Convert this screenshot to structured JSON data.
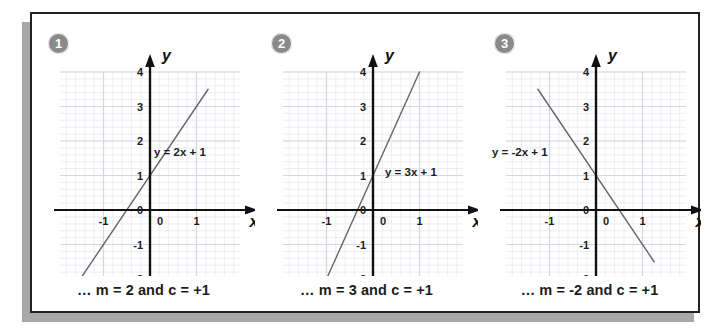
{
  "figure": {
    "background": "#ffffff",
    "border_color": "#222222",
    "shadow_color": "#a8a8a8"
  },
  "colors": {
    "badge_fill": "#8a8a8a",
    "badge_text": "#ffffff",
    "axis": "#111111",
    "grid_minor": "#e9e9f2",
    "grid_major": "#d6d6e2",
    "line": "#666666",
    "text": "#1d1d1d"
  },
  "panels": [
    {
      "badge": "1",
      "caption": "… m = 2 and c = +1",
      "equation_label": "y = 2x + 1",
      "equation_label_pos": {
        "x": 122,
        "y": 108
      },
      "axis_x_name": "x",
      "axis_y_name": "y",
      "chart_data": {
        "type": "line",
        "title": "y = 2x + 1",
        "xlabel": "x",
        "ylabel": "y",
        "slope": 2,
        "intercept": 1,
        "xlim": [
          -1.55,
          1.35
        ],
        "ylim": [
          -2,
          4
        ],
        "x_ticks": [
          -1,
          0,
          1
        ],
        "y_ticks": [
          -2,
          -1,
          0,
          1,
          2,
          3,
          4
        ],
        "x_tick_labels": [
          "-1",
          "0",
          "1"
        ],
        "y_tick_labels": [
          "-2",
          "-1",
          "0",
          "1",
          "2",
          "3",
          "4"
        ],
        "grid": true,
        "grid_minor_step": 0.2,
        "grid_major_step": 1,
        "points": [
          {
            "x": -1.5,
            "y": -2
          },
          {
            "x": 1.25,
            "y": 3.5
          }
        ]
      }
    },
    {
      "badge": "2",
      "caption": "… m = 3 and c = +1",
      "equation_label": "y = 3x + 1",
      "equation_label_pos": {
        "x": 130,
        "y": 128
      },
      "axis_x_name": "x",
      "axis_y_name": "y",
      "chart_data": {
        "type": "line",
        "title": "y = 3x + 1",
        "xlabel": "x",
        "ylabel": "y",
        "slope": 3,
        "intercept": 1,
        "xlim": [
          -1.55,
          1.35
        ],
        "ylim": [
          -2,
          4
        ],
        "x_ticks": [
          -1,
          0,
          1
        ],
        "y_ticks": [
          -2,
          -1,
          0,
          1,
          2,
          3,
          4
        ],
        "x_tick_labels": [
          "-1",
          "0",
          "1"
        ],
        "y_tick_labels": [
          "-2",
          "-1",
          "0",
          "1",
          "2",
          "3",
          "4"
        ],
        "grid": true,
        "grid_minor_step": 0.2,
        "grid_major_step": 1,
        "points": [
          {
            "x": -1,
            "y": -2
          },
          {
            "x": 1,
            "y": 4
          }
        ]
      }
    },
    {
      "badge": "3",
      "caption": "… m = -2 and c = +1",
      "equation_label": "y = -2x + 1",
      "equation_label_pos": {
        "x": 14,
        "y": 108
      },
      "axis_x_name": "x",
      "axis_y_name": "y",
      "chart_data": {
        "type": "line",
        "title": "y = -2x + 1",
        "xlabel": "x",
        "ylabel": "y",
        "slope": -2,
        "intercept": 1,
        "xlim": [
          -1.55,
          1.35
        ],
        "ylim": [
          -2,
          4
        ],
        "x_ticks": [
          -1,
          0,
          1
        ],
        "y_ticks": [
          -2,
          -1,
          0,
          1,
          2,
          3,
          4
        ],
        "x_tick_labels": [
          "-1",
          "0",
          "1"
        ],
        "y_tick_labels": [
          "-2",
          "-1",
          "0",
          "1",
          "2",
          "3",
          "4"
        ],
        "grid": true,
        "grid_minor_step": 0.2,
        "grid_major_step": 1,
        "points": [
          {
            "x": -1.25,
            "y": 3.5
          },
          {
            "x": 1.25,
            "y": -1.5
          }
        ]
      }
    }
  ]
}
